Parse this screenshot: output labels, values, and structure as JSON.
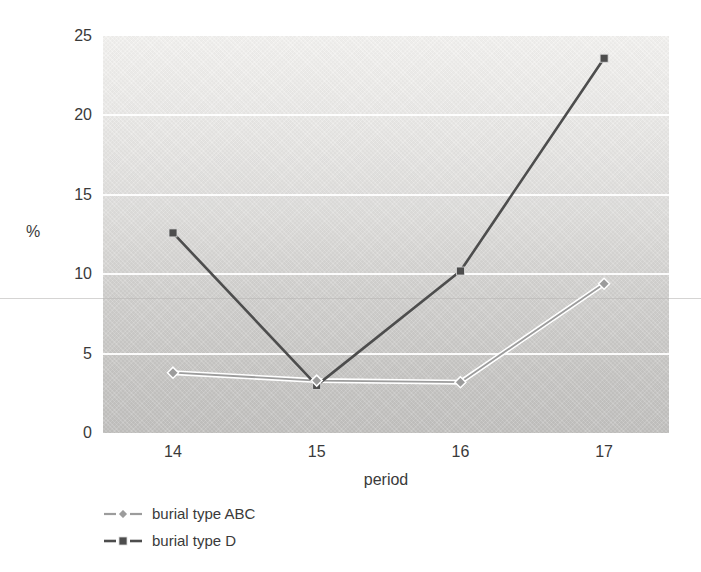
{
  "chart_data": {
    "type": "line",
    "x": [
      14,
      15,
      16,
      17
    ],
    "xlabel": "period",
    "ylabel": "%",
    "ylim": [
      0,
      25
    ],
    "yticks": [
      0,
      5,
      10,
      15,
      20,
      25
    ],
    "grid": "horizontal white gridlines on shaded gradient plot background",
    "legend_position": "below-left",
    "series": [
      {
        "name": "burial type ABC",
        "marker": "diamond",
        "color": "#9c9c9c",
        "casing": "#ffffff",
        "values": [
          3.8,
          3.3,
          3.2,
          9.4
        ]
      },
      {
        "name": "burial type D",
        "marker": "square",
        "color": "#4d4d4d",
        "casing": null,
        "values": [
          12.6,
          3.0,
          10.2,
          23.6
        ]
      }
    ]
  }
}
